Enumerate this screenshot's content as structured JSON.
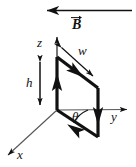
{
  "figure": {
    "type": "physics-vector-diagram",
    "width": 136,
    "height": 167,
    "background_color": "#ffffff",
    "stroke_color": "#111111"
  },
  "axes": {
    "x_label": "x",
    "y_label": "y",
    "z_label": "z",
    "origin": "57,110"
  },
  "field": {
    "label": "B",
    "direction": "left",
    "description": "uniform magnetic field arrow pointing in the negative y direction"
  },
  "dimensions": {
    "width_label": "w",
    "height_label": "h"
  },
  "angle": {
    "label": "θ",
    "description": "angle between the y axis and the bottom edge of the loop"
  },
  "loop": {
    "description": "rectangular current loop tilted about the z axis",
    "corner_top_left": "57,57",
    "corner_top_right": "98,88",
    "corner_bottom_right": "98,137",
    "corner_bottom_left": "57,110",
    "current_arrows": [
      "down-right top edge",
      "down right edge",
      "up-left bottom edge",
      "up left edge"
    ]
  }
}
